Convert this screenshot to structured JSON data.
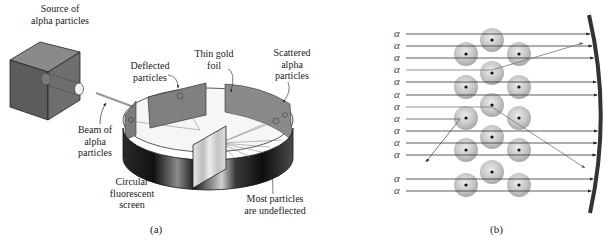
{
  "figure": {
    "panel_a": {
      "label": "(a)",
      "labels": {
        "source": [
          "Source of",
          "alpha particles"
        ],
        "deflected": [
          "Deflected",
          "particles"
        ],
        "foil": [
          "Thin gold",
          "foil"
        ],
        "scattered": [
          "Scattered",
          "alpha",
          "particles"
        ],
        "beam": [
          "Beam of",
          "alpha",
          "particles"
        ],
        "screen": [
          "Circular",
          "fluorescent",
          "screen"
        ],
        "undeflected": [
          "Most particles",
          "are undeflected"
        ]
      }
    },
    "panel_b": {
      "label": "(b)",
      "alpha_symbol": "α",
      "alpha_rows_y": [
        34,
        46,
        58,
        70,
        82,
        95,
        107,
        119,
        131,
        143,
        155,
        179,
        191
      ],
      "atoms": [
        {
          "x": 492,
          "y": 40
        },
        {
          "x": 492,
          "y": 73
        },
        {
          "x": 492,
          "y": 105
        },
        {
          "x": 492,
          "y": 137
        },
        {
          "x": 492,
          "y": 172
        },
        {
          "x": 466,
          "y": 54
        },
        {
          "x": 466,
          "y": 87
        },
        {
          "x": 466,
          "y": 118
        },
        {
          "x": 466,
          "y": 150
        },
        {
          "x": 466,
          "y": 185
        },
        {
          "x": 519,
          "y": 54
        },
        {
          "x": 519,
          "y": 87
        },
        {
          "x": 519,
          "y": 118
        },
        {
          "x": 519,
          "y": 150
        },
        {
          "x": 519,
          "y": 185
        }
      ]
    }
  }
}
